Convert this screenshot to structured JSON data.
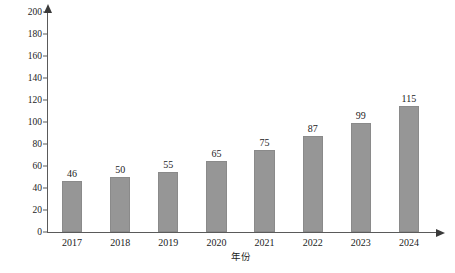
{
  "chart_data": {
    "type": "bar",
    "title": "",
    "subtitle": "",
    "xlabel": "年份",
    "ylabel": "市场规模/亿美元",
    "categories": [
      "2017",
      "2018",
      "2019",
      "2020",
      "2021",
      "2022",
      "2023",
      "2024"
    ],
    "values": [
      46,
      50,
      55,
      65,
      75,
      87,
      99,
      115
    ],
    "data_labels": [
      "46",
      "50",
      "55",
      "65",
      "75",
      "87",
      "99",
      "115"
    ],
    "ylim": [
      0,
      200
    ],
    "ytick_labels": [
      "0",
      "20",
      "40",
      "60",
      "80",
      "100",
      "120",
      "140",
      "160",
      "180",
      "200"
    ],
    "ytick_values": [
      0,
      20,
      40,
      60,
      80,
      100,
      120,
      140,
      160,
      180,
      200
    ],
    "grid": false,
    "legend": null,
    "legend_position": "none",
    "bar_color": "#969696",
    "bar_edge_color": "#8a8a8a",
    "axis_color": "#5a5a5a",
    "background_color": "#ffffff",
    "axis_arrows": true,
    "annotations": []
  }
}
